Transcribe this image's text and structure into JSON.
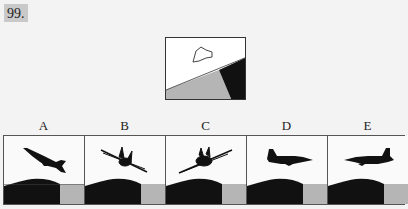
{
  "question": {
    "number": "99."
  },
  "reference": {
    "description": "view from cockpit: cloud in sky, horizon tilted, gray land left, black land right",
    "icons": [
      "cloud-outline-icon",
      "horizon-line",
      "gray-ground",
      "black-ground"
    ]
  },
  "options": [
    {
      "label": "A",
      "aircraft": "aircraft-climbing-left-side-view"
    },
    {
      "label": "B",
      "aircraft": "aircraft-front-view-banked-right"
    },
    {
      "label": "C",
      "aircraft": "aircraft-front-view-banked-left"
    },
    {
      "label": "D",
      "aircraft": "aircraft-side-view-facing-right"
    },
    {
      "label": "E",
      "aircraft": "aircraft-side-view-facing-left"
    }
  ],
  "colors": {
    "background": "#f3f3f3",
    "black_ground": "#111111",
    "gray_ground": "#b5b5b5",
    "label_bg": "#c9c9c9"
  }
}
